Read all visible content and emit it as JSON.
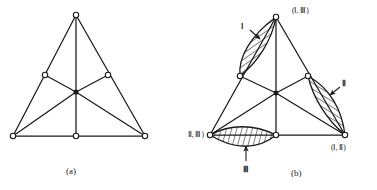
{
  "figure": {
    "type": "diagram",
    "background_color": "#ffffff",
    "stroke_color": "#1a1a1a",
    "hatch_color": "#1a1a1a",
    "node_fill": "#ffffff"
  },
  "panels": [
    {
      "id": "a",
      "caption": "(a)",
      "nodes": [
        {
          "name": "apex",
          "x": 76,
          "y": 15
        },
        {
          "name": "left-mid",
          "x": 45,
          "y": 75
        },
        {
          "name": "right-mid",
          "x": 108,
          "y": 75
        },
        {
          "name": "center",
          "x": 76,
          "y": 92
        },
        {
          "name": "bottom-left",
          "x": 13,
          "y": 136
        },
        {
          "name": "bottom-mid",
          "x": 76,
          "y": 136
        },
        {
          "name": "bottom-right",
          "x": 145,
          "y": 136
        }
      ],
      "edges": [
        [
          "apex",
          "bottom-left"
        ],
        [
          "apex",
          "bottom-right"
        ],
        [
          "bottom-left",
          "bottom-right"
        ],
        [
          "apex",
          "center"
        ],
        [
          "center",
          "bottom-mid"
        ],
        [
          "left-mid",
          "center"
        ],
        [
          "right-mid",
          "center"
        ],
        [
          "bottom-left",
          "center"
        ],
        [
          "bottom-right",
          "center"
        ]
      ]
    },
    {
      "id": "b",
      "caption": "(b)",
      "nodes": [
        {
          "name": "apex",
          "x": 88,
          "y": 17,
          "label": "(Ⅰ, Ⅲ)",
          "label_x": 104,
          "label_y": 11
        },
        {
          "name": "left-mid",
          "x": 52,
          "y": 76,
          "label": null
        },
        {
          "name": "right-mid",
          "x": 120,
          "y": 76,
          "label": null
        },
        {
          "name": "center",
          "x": 88,
          "y": 93,
          "label": null
        },
        {
          "name": "bottom-left",
          "x": 22,
          "y": 135,
          "label": "(Ⅱ, Ⅲ)",
          "label_x": -16,
          "label_y": 134
        },
        {
          "name": "bottom-mid",
          "x": 88,
          "y": 135,
          "label": null
        },
        {
          "name": "bottom-right",
          "x": 157,
          "y": 135,
          "label": "(Ⅰ, Ⅱ)",
          "label_x": 141,
          "label_y": 150
        }
      ],
      "regions": [
        {
          "name": "region-I",
          "label": "Ⅰ",
          "label_x": 54,
          "label_y": 29,
          "arrow_from": [
            62,
            30
          ],
          "arrow_to": [
            72,
            39
          ]
        },
        {
          "name": "region-II",
          "label": "Ⅱ",
          "label_x": 155,
          "label_y": 84,
          "arrow_from": [
            152,
            87
          ],
          "arrow_to": [
            142,
            95
          ]
        },
        {
          "name": "region-III",
          "label": "Ⅲ",
          "label_x": 56,
          "label_y": 168,
          "arrow_from": [
            58,
            161
          ],
          "arrow_to": [
            58,
            145
          ]
        }
      ]
    }
  ]
}
